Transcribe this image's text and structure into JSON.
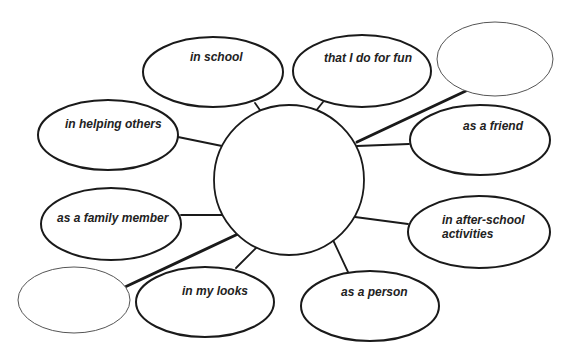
{
  "diagram": {
    "type": "concept-web",
    "stroke_color": "#1a1a1a",
    "blank_stroke_color": "#555555",
    "center": {
      "cx": 289,
      "cy": 180,
      "r": 75,
      "label": ""
    },
    "nodes": [
      {
        "id": "in-school",
        "lines": [
          "in school"
        ],
        "cx": 213,
        "cy": 72,
        "rx": 70,
        "ry": 35,
        "text_x": 190,
        "text_y": 61,
        "blank": false,
        "link": {
          "x1": 255,
          "y1": 103,
          "x2": 262,
          "y2": 113,
          "w": 1.8
        }
      },
      {
        "id": "that-i-do-for-fun",
        "lines": [
          "that I do for fun"
        ],
        "cx": 362,
        "cy": 71,
        "rx": 69,
        "ry": 36,
        "text_x": 324,
        "text_y": 62,
        "blank": false,
        "link": {
          "x1": 323,
          "y1": 102,
          "x2": 315,
          "y2": 112,
          "w": 1.8
        }
      },
      {
        "id": "blank-top-right",
        "lines": [],
        "cx": 495,
        "cy": 59,
        "rx": 58,
        "ry": 37,
        "blank": true,
        "link": {
          "x1": 470,
          "y1": 89,
          "x2": 357,
          "y2": 142,
          "w": 3
        }
      },
      {
        "id": "in-helping-others",
        "lines": [
          "in helping others"
        ],
        "cx": 108,
        "cy": 135,
        "rx": 70,
        "ry": 35,
        "text_x": 65,
        "text_y": 128,
        "blank": false,
        "link": {
          "x1": 178,
          "y1": 137,
          "x2": 222,
          "y2": 146,
          "w": 1.8
        }
      },
      {
        "id": "as-a-friend",
        "lines": [
          "as a friend"
        ],
        "cx": 480,
        "cy": 140,
        "rx": 70,
        "ry": 35,
        "text_x": 463,
        "text_y": 130,
        "blank": false,
        "link": {
          "x1": 409,
          "y1": 144,
          "x2": 357,
          "y2": 146,
          "w": 1.8
        }
      },
      {
        "id": "as-a-family-member",
        "lines": [
          "as a family member"
        ],
        "cx": 111,
        "cy": 224,
        "rx": 70,
        "ry": 36,
        "text_x": 57,
        "text_y": 222,
        "blank": false,
        "link": {
          "x1": 181,
          "y1": 215,
          "x2": 222,
          "y2": 215,
          "w": 1.8
        }
      },
      {
        "id": "in-after-school-activities",
        "lines": [
          "in after-school",
          "activities"
        ],
        "cx": 479,
        "cy": 232,
        "rx": 71,
        "ry": 36,
        "text_x": 442,
        "text_y": 224,
        "blank": false,
        "link": {
          "x1": 408,
          "y1": 224,
          "x2": 355,
          "y2": 217,
          "w": 1.8
        }
      },
      {
        "id": "blank-bottom-left",
        "lines": [],
        "cx": 74,
        "cy": 300,
        "rx": 56,
        "ry": 33,
        "blank": true,
        "link": {
          "x1": 125,
          "y1": 287,
          "x2": 238,
          "y2": 234,
          "w": 3
        }
      },
      {
        "id": "in-my-looks",
        "lines": [
          "in my looks"
        ],
        "cx": 205,
        "cy": 302,
        "rx": 69,
        "ry": 35,
        "text_x": 182,
        "text_y": 295,
        "blank": false,
        "link": {
          "x1": 236,
          "y1": 268,
          "x2": 258,
          "y2": 246,
          "w": 1.8
        }
      },
      {
        "id": "as-a-person",
        "lines": [
          "as a person"
        ],
        "cx": 370,
        "cy": 306,
        "rx": 69,
        "ry": 35,
        "text_x": 341,
        "text_y": 296,
        "blank": false,
        "link": {
          "x1": 348,
          "y1": 272,
          "x2": 333,
          "y2": 240,
          "w": 1.8
        }
      }
    ]
  }
}
